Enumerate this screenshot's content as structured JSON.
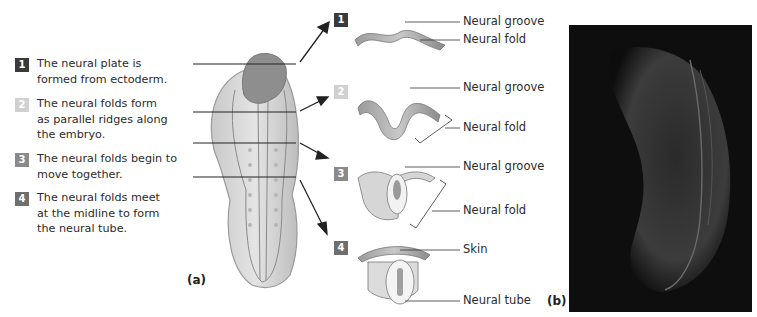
{
  "figure": {
    "panel_a_label": "(a)",
    "panel_b_label": "(b)",
    "steps": [
      {
        "number": "1",
        "text": "The neural plate is formed from ectoderm.",
        "badge_color": "#3a3a3a"
      },
      {
        "number": "2",
        "text": "The neural folds form as parallel ridges along the embryo.",
        "badge_color": "#d0d0d0"
      },
      {
        "number": "3",
        "text": "The neural folds begin to move together.",
        "badge_color": "#8a8a8a"
      },
      {
        "number": "4",
        "text": "The neural folds meet at the midline to form the neural tube.",
        "badge_color": "#6e6e6e"
      }
    ],
    "cross_sections": [
      {
        "number": "1",
        "labels": [
          "Neural groove",
          "Neural fold"
        ]
      },
      {
        "number": "2",
        "labels": [
          "Neural groove",
          "Neural fold"
        ]
      },
      {
        "number": "3",
        "labels": [
          "Neural groove",
          "Neural fold"
        ]
      },
      {
        "number": "4",
        "labels": [
          "Skin",
          "Neural tube"
        ]
      }
    ],
    "photo_description": "Micrograph of embryo on black background"
  }
}
